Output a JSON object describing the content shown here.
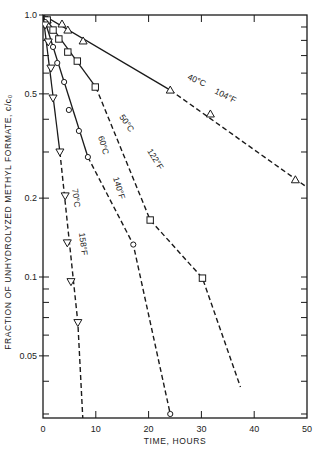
{
  "chart_data": {
    "type": "line",
    "title": "",
    "xlabel": "TIME, HOURS",
    "ylabel": "FRACTION OF UNHYDROLYZED METHYL FORMATE, c/c₀",
    "xlim": [
      0,
      50
    ],
    "ylim": [
      0.025,
      1.0
    ],
    "yscale": "log",
    "grid": false,
    "x_ticks": [
      0,
      10,
      20,
      30,
      40,
      50
    ],
    "x_tick_labels": [
      "0",
      "10",
      "20",
      "30",
      "40",
      "50"
    ],
    "y_ticks": [
      1.0,
      0.5,
      0.2,
      0.1,
      0.05
    ],
    "y_tick_labels": [
      "1.0",
      "0.5",
      "0.2",
      "0.1",
      "0.05"
    ],
    "series": [
      {
        "name": "40°C / 104°F",
        "label_c": "40°C",
        "label_f": "104°F",
        "marker": "triangle-up",
        "x": [
          0.8,
          3.6,
          4.7,
          7.6,
          24.1,
          31.7,
          47.8
        ],
        "values": [
          0.957,
          0.924,
          0.876,
          0.796,
          0.517,
          0.419,
          0.235
        ],
        "fit_line": {
          "x": [
            0,
            50
          ],
          "y": [
            1.0,
            0.22
          ]
        }
      },
      {
        "name": "50°C / 122°F",
        "label_c": "50°C",
        "label_f": "122°F",
        "marker": "square",
        "x": [
          0.8,
          1.9,
          3.0,
          4.7,
          6.5,
          9.9,
          20.3,
          30.2
        ],
        "values": [
          0.957,
          0.876,
          0.81,
          0.722,
          0.667,
          0.531,
          0.165,
          0.099
        ],
        "fit_line": {
          "x": [
            0,
            10,
            20.3,
            30.2,
            37.4
          ],
          "y": [
            1.0,
            0.531,
            0.165,
            0.099,
            0.038
          ]
        }
      },
      {
        "name": "60°C / 140°F",
        "label_c": "60°C",
        "label_f": "140°F",
        "marker": "circle",
        "x": [
          0.4,
          1.9,
          2.7,
          4.0,
          4.9,
          6.8,
          8.5,
          17.1,
          24.1
        ],
        "values": [
          0.94,
          0.755,
          0.656,
          0.555,
          0.434,
          0.361,
          0.287,
          0.133,
          0.03
        ],
        "fit_line": {
          "x": [
            0,
            8.5,
            17.1,
            24.1
          ],
          "y": [
            1.0,
            0.287,
            0.133,
            0.03
          ]
        }
      },
      {
        "name": "70°C / 158°F",
        "label_c": "70°C",
        "label_f": "158°F",
        "marker": "triangle-down",
        "x": [
          0.4,
          1.0,
          1.5,
          1.9,
          3.2,
          4.2,
          4.6,
          5.3,
          6.6
        ],
        "values": [
          0.916,
          0.789,
          0.627,
          0.482,
          0.3,
          0.204,
          0.135,
          0.096,
          0.067
        ],
        "fit_line": {
          "x": [
            0,
            3.2,
            6.6,
            7.7
          ],
          "y": [
            1.0,
            0.3,
            0.067,
            0.025
          ]
        }
      }
    ]
  },
  "colors": {
    "ink": "#1a1a1a",
    "background": "#ffffff"
  }
}
